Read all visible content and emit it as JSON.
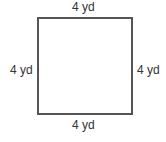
{
  "shape": "square",
  "labels": {
    "top": "4 yd",
    "bottom": "4 yd",
    "left": "4 yd",
    "right": "4 yd"
  }
}
